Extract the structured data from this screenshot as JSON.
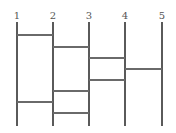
{
  "diagram": {
    "type": "ladder-diagram",
    "line_top": 22,
    "line_bottom": 126,
    "line_color": "#5a5a5a",
    "rung_color": "#6a6a6a",
    "lines": [
      {
        "label": "1",
        "x": 17
      },
      {
        "label": "2",
        "x": 53
      },
      {
        "label": "3",
        "x": 89
      },
      {
        "label": "4",
        "x": 125
      },
      {
        "label": "5",
        "x": 162
      }
    ],
    "rungs": [
      {
        "from": 1,
        "to": 2,
        "y": 35
      },
      {
        "from": 2,
        "to": 3,
        "y": 47
      },
      {
        "from": 3,
        "to": 4,
        "y": 58
      },
      {
        "from": 4,
        "to": 5,
        "y": 69
      },
      {
        "from": 3,
        "to": 4,
        "y": 80
      },
      {
        "from": 2,
        "to": 3,
        "y": 91
      },
      {
        "from": 1,
        "to": 2,
        "y": 102
      },
      {
        "from": 2,
        "to": 3,
        "y": 113
      }
    ]
  }
}
